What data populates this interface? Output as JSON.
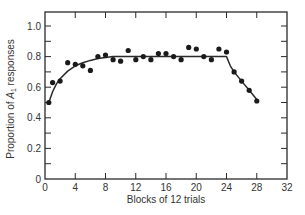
{
  "chart_data": {
    "type": "scatter",
    "title": "",
    "xlabel": "Blocks of 12 trials",
    "ylabel": "Proportion of A1 responses",
    "ylabel_main": "Proportion of ",
    "ylabel_var": "A",
    "ylabel_sub": "1",
    "ylabel_tail": " responses",
    "xlim": [
      0,
      32
    ],
    "ylim": [
      0,
      1.0
    ],
    "x_ticks": [
      0,
      4,
      8,
      12,
      16,
      20,
      24,
      28,
      32
    ],
    "x_tick_labels": [
      "0",
      "4",
      "8",
      "12",
      "16",
      "20",
      "24",
      "28",
      "32"
    ],
    "y_ticks": [
      0,
      0.1,
      0.2,
      0.3,
      0.4,
      0.5,
      0.6,
      0.7,
      0.8,
      0.9,
      1.0
    ],
    "y_tick_labels": [
      "0",
      "",
      "0.2",
      "",
      "0.4",
      "",
      "0.6",
      "",
      "0.8",
      "",
      "1.0"
    ],
    "grid": false,
    "legend": null,
    "series": [
      {
        "name": "Observed",
        "kind": "points",
        "x": [
          0.5,
          1,
          2,
          3,
          4,
          5,
          6,
          7,
          8,
          9,
          10,
          11,
          12,
          13,
          14,
          15,
          16,
          17,
          18,
          19,
          20,
          21,
          22,
          23,
          24,
          25,
          26,
          27,
          28
        ],
        "y": [
          0.5,
          0.63,
          0.64,
          0.76,
          0.75,
          0.74,
          0.71,
          0.8,
          0.81,
          0.78,
          0.77,
          0.84,
          0.78,
          0.8,
          0.78,
          0.82,
          0.82,
          0.8,
          0.78,
          0.86,
          0.85,
          0.8,
          0.78,
          0.85,
          0.83,
          0.7,
          0.64,
          0.58,
          0.51
        ]
      },
      {
        "name": "Theoretical curve",
        "kind": "line",
        "x": [
          0.5,
          1,
          1.5,
          2,
          3,
          4,
          5,
          6,
          7,
          8,
          9,
          10,
          12,
          16,
          20,
          24,
          24.5,
          25,
          26,
          27,
          28
        ],
        "y": [
          0.5,
          0.57,
          0.62,
          0.655,
          0.705,
          0.74,
          0.76,
          0.775,
          0.787,
          0.795,
          0.8,
          0.8,
          0.8,
          0.8,
          0.8,
          0.8,
          0.74,
          0.7,
          0.64,
          0.58,
          0.52
        ]
      }
    ]
  }
}
